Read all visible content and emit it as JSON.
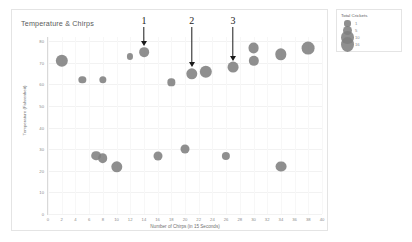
{
  "chart_data": {
    "type": "scatter",
    "title": "Temperature & Chirps",
    "xlabel": "Number of Chirps (in 15 Seconds)",
    "ylabel": "Temperature (Fahrenheit)",
    "xlim": [
      0,
      40
    ],
    "ylim": [
      0,
      82
    ],
    "grid": true,
    "legend_position": "top-right",
    "size_legend": {
      "title": "Total Crickets",
      "entries": [
        {
          "label": "1",
          "size": 1
        },
        {
          "label": "5",
          "size": 5
        },
        {
          "label": "10",
          "size": 10
        },
        {
          "label": "16",
          "size": 16
        }
      ]
    },
    "xticks": [
      0,
      2,
      4,
      6,
      8,
      10,
      12,
      14,
      16,
      18,
      20,
      22,
      24,
      26,
      28,
      30,
      32,
      34,
      36,
      38,
      40
    ],
    "yticks": [
      80,
      70,
      60,
      50,
      40,
      30,
      20,
      10,
      0
    ],
    "series": [
      {
        "name": "Crickets",
        "marker_color": "#7f7f7f",
        "points": [
          {
            "x": 2,
            "y": 71,
            "size": 10
          },
          {
            "x": 5,
            "y": 62,
            "size": 2
          },
          {
            "x": 7,
            "y": 27,
            "size": 5
          },
          {
            "x": 8,
            "y": 62,
            "size": 2
          },
          {
            "x": 8,
            "y": 26,
            "size": 5
          },
          {
            "x": 10,
            "y": 22,
            "size": 8
          },
          {
            "x": 12,
            "y": 73,
            "size": 1
          },
          {
            "x": 14,
            "y": 75,
            "size": 5
          },
          {
            "x": 16,
            "y": 27,
            "size": 4
          },
          {
            "x": 18,
            "y": 61,
            "size": 2
          },
          {
            "x": 20,
            "y": 30,
            "size": 4
          },
          {
            "x": 21,
            "y": 65,
            "size": 8
          },
          {
            "x": 23,
            "y": 66,
            "size": 10
          },
          {
            "x": 26,
            "y": 27,
            "size": 3
          },
          {
            "x": 27,
            "y": 68,
            "size": 7
          },
          {
            "x": 30,
            "y": 77,
            "size": 7
          },
          {
            "x": 30,
            "y": 71,
            "size": 6
          },
          {
            "x": 34,
            "y": 74,
            "size": 8
          },
          {
            "x": 34,
            "y": 22,
            "size": 7
          },
          {
            "x": 38,
            "y": 77,
            "size": 11
          }
        ]
      }
    ],
    "annotations": [
      {
        "label": "1",
        "x": 14,
        "y": 75
      },
      {
        "label": "2",
        "x": 21,
        "y": 65
      },
      {
        "label": "3",
        "x": 27,
        "y": 68
      }
    ]
  }
}
